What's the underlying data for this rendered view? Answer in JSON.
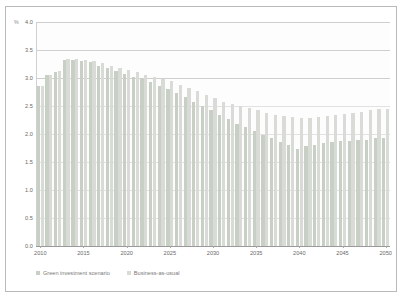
{
  "chart_data": {
    "type": "bar",
    "title": "",
    "subtitle": "",
    "xlabel": "",
    "ylabel": "",
    "yunit": "%",
    "ylim": [
      0.0,
      4.0
    ],
    "ytick_labels": [
      "0.0",
      "0.5",
      "1.0",
      "1.5",
      "2.0",
      "2.5",
      "3.0",
      "3.5",
      "4.0"
    ],
    "ytick_values": [
      0.0,
      0.5,
      1.0,
      1.5,
      2.0,
      2.5,
      3.0,
      3.5,
      4.0
    ],
    "xtick_labels": [
      "2010",
      "2015",
      "2020",
      "2025",
      "2030",
      "2035",
      "2040",
      "2045",
      "2050"
    ],
    "xtick_values": [
      2010,
      2015,
      2020,
      2025,
      2030,
      2035,
      2040,
      2045,
      2050
    ],
    "xlim": [
      2009.5,
      2050.5
    ],
    "grid": true,
    "legend_position": "bottom-left",
    "categories": [
      2010,
      2011,
      2012,
      2013,
      2014,
      2015,
      2016,
      2017,
      2018,
      2019,
      2020,
      2021,
      2022,
      2023,
      2024,
      2025,
      2026,
      2027,
      2028,
      2029,
      2030,
      2031,
      2032,
      2033,
      2034,
      2035,
      2036,
      2037,
      2038,
      2039,
      2040,
      2041,
      2042,
      2043,
      2044,
      2045,
      2046,
      2047,
      2048,
      2049,
      2050
    ],
    "series": [
      {
        "name": "Green investment scenario",
        "color": "#c8cfc4",
        "values": [
          2.85,
          3.05,
          3.1,
          3.32,
          3.32,
          3.3,
          3.28,
          3.22,
          3.18,
          3.12,
          3.08,
          3.02,
          2.98,
          2.92,
          2.86,
          2.8,
          2.74,
          2.66,
          2.58,
          2.5,
          2.42,
          2.34,
          2.26,
          2.18,
          2.12,
          2.05,
          1.98,
          1.92,
          1.86,
          1.8,
          1.74,
          1.78,
          1.8,
          1.84,
          1.86,
          1.88,
          1.88,
          1.9,
          1.9,
          1.92,
          1.92
        ]
      },
      {
        "name": "Business-as-usual",
        "color": "#d9dcd6",
        "values": [
          2.85,
          3.06,
          3.12,
          3.34,
          3.34,
          3.32,
          3.3,
          3.26,
          3.22,
          3.18,
          3.14,
          3.1,
          3.06,
          3.02,
          2.98,
          2.94,
          2.88,
          2.82,
          2.76,
          2.7,
          2.64,
          2.58,
          2.54,
          2.5,
          2.46,
          2.42,
          2.38,
          2.34,
          2.32,
          2.3,
          2.28,
          2.28,
          2.3,
          2.32,
          2.34,
          2.36,
          2.38,
          2.4,
          2.42,
          2.44,
          2.44
        ]
      }
    ]
  },
  "legend": {
    "items": [
      {
        "label": "Green investment scenario"
      },
      {
        "label": "Business-as-usual"
      }
    ]
  }
}
